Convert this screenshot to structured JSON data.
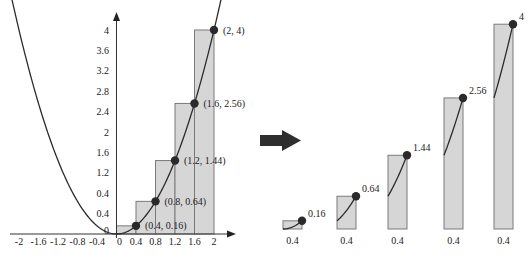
{
  "figure": {
    "caption": "",
    "colors": {
      "curve": "#2b2b2b",
      "axis": "#333333",
      "bar_fill": "#d6d6d6",
      "bar_stroke": "#7a7a7a",
      "dot": "#2a2a2a",
      "arrow": "#2e2e2e",
      "text": "#222222"
    }
  },
  "chart_data": [
    {
      "type": "line",
      "title": "",
      "function": "y = x^2",
      "xlabel": "",
      "ylabel": "",
      "xlim": [
        -2.2,
        2.3
      ],
      "ylim": [
        0,
        4.4
      ],
      "grid": false,
      "x_ticks": [
        "-2",
        "-1.6",
        "-1.2",
        "-0.8",
        "-0.4",
        "0",
        "0.4",
        "0.8",
        "1.2",
        "1.6",
        "2"
      ],
      "x_tick_values": [
        -2,
        -1.6,
        -1.2,
        -0.8,
        -0.4,
        0,
        0.4,
        0.8,
        1.2,
        1.6,
        2
      ],
      "y_ticks": [
        "0",
        "0.4",
        "0.4",
        "1.2",
        "1.6",
        "2",
        "2.4",
        "2.8",
        "3.2",
        "3.6",
        "4"
      ],
      "y_tick_values": [
        0,
        0.4,
        0.8,
        1.2,
        1.6,
        2,
        2.4,
        2.8,
        3.2,
        3.6,
        4
      ],
      "rectangles": [
        {
          "x0": 0,
          "x1": 0.4,
          "height": 0.16
        },
        {
          "x0": 0.4,
          "x1": 0.8,
          "height": 0.64
        },
        {
          "x0": 0.8,
          "x1": 1.2,
          "height": 1.44
        },
        {
          "x0": 1.2,
          "x1": 1.6,
          "height": 2.56
        },
        {
          "x0": 1.6,
          "x1": 2.0,
          "height": 4
        }
      ],
      "points": [
        {
          "x": 0.4,
          "y": 0.16,
          "label": "(0.4, 0.16)"
        },
        {
          "x": 0.8,
          "y": 0.64,
          "label": "(0.8, 0.64)"
        },
        {
          "x": 1.2,
          "y": 1.44,
          "label": "(1.2, 1.44)"
        },
        {
          "x": 1.6,
          "y": 2.56,
          "label": "(1.6, 2.56)"
        },
        {
          "x": 2,
          "y": 4,
          "label": "(2, 4)"
        }
      ]
    },
    {
      "type": "bar",
      "title": "",
      "categories": [
        "0.4",
        "0.4",
        "0.4",
        "0.4",
        "0.4"
      ],
      "values": [
        0.16,
        0.64,
        1.44,
        2.56,
        4
      ],
      "value_labels": [
        "0.16",
        "0.64",
        "1.44",
        "2.56",
        "4"
      ],
      "width_label": "0.4",
      "xlabel": "",
      "ylabel": "",
      "ylim": [
        0,
        4
      ]
    }
  ],
  "transition_arrow": "right-arrow"
}
